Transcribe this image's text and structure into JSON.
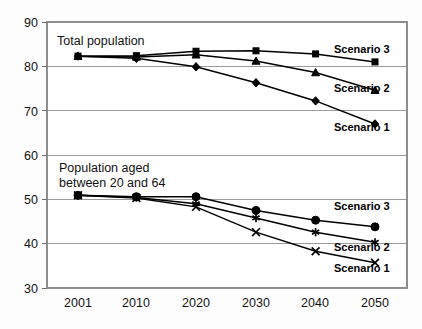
{
  "chart_data": {
    "type": "line",
    "title": "",
    "xlabel": "",
    "ylabel": "",
    "x": [
      "2001",
      "2010",
      "2020",
      "2030",
      "2040",
      "2050"
    ],
    "xlim": [
      2001,
      2050
    ],
    "ylim": [
      30,
      90
    ],
    "yticks": [
      30,
      40,
      50,
      60,
      70,
      80,
      90
    ],
    "grid": true,
    "legend_position": "inline-right",
    "panels": [
      {
        "name": "total-population",
        "annotation": "Total population",
        "series": [
          {
            "name": "Scenario 3",
            "marker": "square",
            "label": "Scenario 3",
            "values": [
              82.3,
              82.4,
              83.4,
              83.5,
              82.8,
              81.0
            ]
          },
          {
            "name": "Scenario 2",
            "marker": "triangle",
            "label": "Scenario 2",
            "values": [
              82.3,
              82.1,
              82.6,
              81.2,
              78.6,
              74.6
            ]
          },
          {
            "name": "Scenario 1",
            "marker": "diamond",
            "label": "Scenario 1",
            "values": [
              82.3,
              81.8,
              79.9,
              76.3,
              72.2,
              67.0
            ]
          }
        ]
      },
      {
        "name": "population-aged-20-64",
        "annotation": "Population aged\nbetween 20 and 64",
        "annotation_line1": "Population aged",
        "annotation_line2": "between 20 and 64",
        "series": [
          {
            "name": "Scenario 3",
            "marker": "circle",
            "label": "Scenario 3",
            "values": [
              50.9,
              50.6,
              50.6,
              47.5,
              45.3,
              43.8
            ]
          },
          {
            "name": "Scenario 2",
            "marker": "asterisk",
            "label": "Scenario 2",
            "values": [
              50.9,
              50.4,
              49.0,
              45.8,
              42.6,
              40.3
            ]
          },
          {
            "name": "Scenario 1",
            "marker": "cross",
            "label": "Scenario 1",
            "values": [
              50.9,
              50.3,
              48.3,
              42.6,
              38.3,
              35.7
            ]
          }
        ]
      }
    ]
  },
  "axes": {
    "y_labels": [
      "90",
      "80",
      "70",
      "60",
      "50",
      "40",
      "30"
    ],
    "x_labels": [
      "2001",
      "2010",
      "2020",
      "2030",
      "2040",
      "2050"
    ]
  },
  "annotations": {
    "top_panel": "Total population",
    "bottom_panel_line1": "Population aged",
    "bottom_panel_line2": "between 20 and 64",
    "top_scenario_3": "Scenario 3",
    "top_scenario_2": "Scenario 2",
    "top_scenario_1": "Scenario 1",
    "bottom_scenario_3": "Scenario 3",
    "bottom_scenario_2": "Scenario 2",
    "bottom_scenario_1": "Scenario 1"
  },
  "colors": {
    "line": "#000000",
    "grid": "#9a9a9a",
    "frame": "#8d8d8d",
    "text": "#111111",
    "background": "#fdfdfd"
  }
}
